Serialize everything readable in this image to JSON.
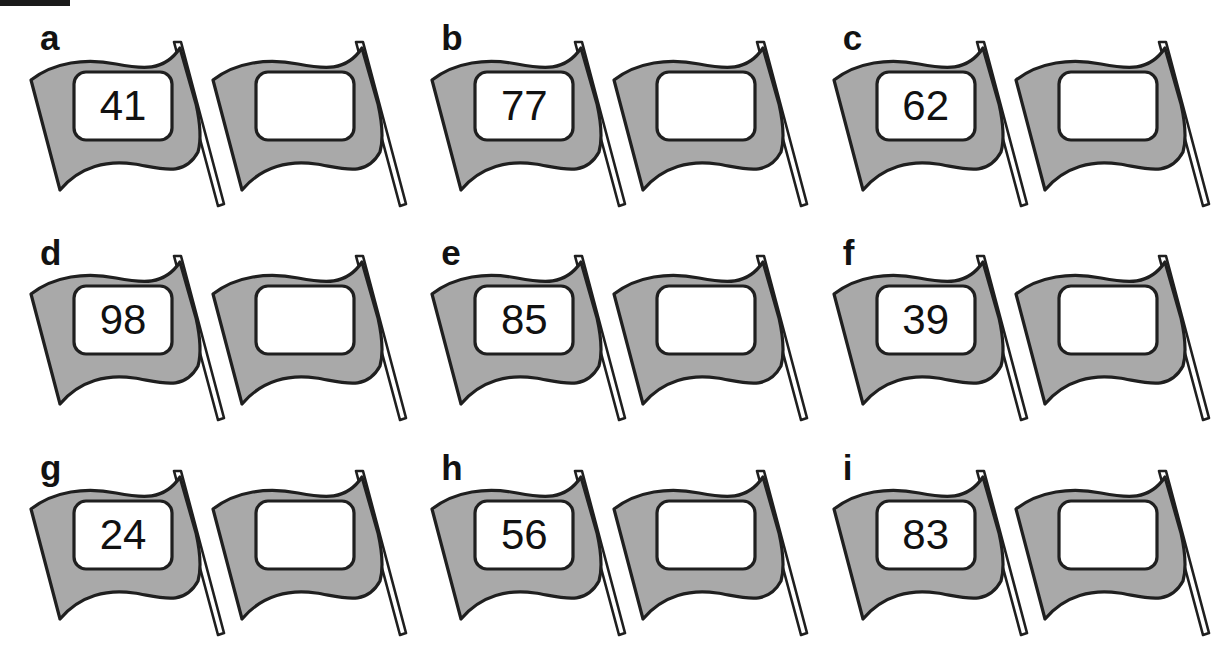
{
  "figure": {
    "type": "diagram",
    "background_color": "#ffffff",
    "flag_fill_color": "#a9a9a9",
    "flag_outline_color": "#1f1f1f",
    "flag_inner_panel_color": "#ffffff",
    "label_color": "#121212",
    "number_color": "#111111",
    "top_rule_color": "#1a1a1a",
    "columns": 3,
    "rows": 3
  },
  "panels": [
    {
      "label": "a",
      "left_flag_value": "41",
      "right_flag_value": ""
    },
    {
      "label": "b",
      "left_flag_value": "77",
      "right_flag_value": ""
    },
    {
      "label": "c",
      "left_flag_value": "62",
      "right_flag_value": ""
    },
    {
      "label": "d",
      "left_flag_value": "98",
      "right_flag_value": ""
    },
    {
      "label": "e",
      "left_flag_value": "85",
      "right_flag_value": ""
    },
    {
      "label": "f",
      "left_flag_value": "39",
      "right_flag_value": ""
    },
    {
      "label": "g",
      "left_flag_value": "24",
      "right_flag_value": ""
    },
    {
      "label": "h",
      "left_flag_value": "56",
      "right_flag_value": ""
    },
    {
      "label": "i",
      "left_flag_value": "83",
      "right_flag_value": ""
    }
  ]
}
